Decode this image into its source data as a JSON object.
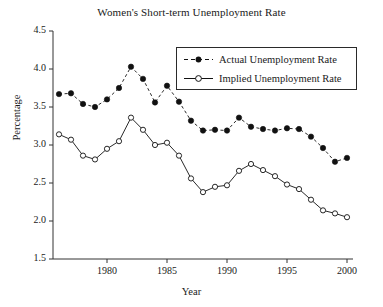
{
  "chart_data": {
    "type": "line",
    "title": "Women's Short-term Unemployment Rate",
    "xlabel": "Year",
    "ylabel": "Percentage",
    "xlim": [
      1975.5,
      2000.5
    ],
    "ylim": [
      1.5,
      4.5
    ],
    "grid": false,
    "legend_position": "upper-right",
    "x_ticks": [
      1980,
      1985,
      1990,
      1995,
      2000
    ],
    "x_tick_labels": [
      "1980",
      "1985",
      "1990",
      "1995",
      "2000"
    ],
    "y_ticks": [
      1.5,
      2.0,
      2.5,
      3.0,
      3.5,
      4.0,
      4.5
    ],
    "y_tick_labels": [
      "1.5",
      "2.0",
      "2.5",
      "3.0",
      "3.5",
      "4.0",
      "4.5"
    ],
    "x": [
      1976,
      1977,
      1978,
      1979,
      1980,
      1981,
      1982,
      1983,
      1984,
      1985,
      1986,
      1987,
      1988,
      1989,
      1990,
      1991,
      1992,
      1993,
      1994,
      1995,
      1996,
      1997,
      1998,
      1999,
      2000
    ],
    "series": [
      {
        "name": "Actual Unemployment Rate",
        "marker": "filled-circle",
        "linestyle": "dashed",
        "color": "#111111",
        "values": [
          3.67,
          3.68,
          3.54,
          3.5,
          3.6,
          3.75,
          4.03,
          3.87,
          3.56,
          3.78,
          3.57,
          3.32,
          3.19,
          3.2,
          3.19,
          3.36,
          3.24,
          3.21,
          3.19,
          3.22,
          3.21,
          3.11,
          2.96,
          2.78,
          2.83
        ]
      },
      {
        "name": "Implied Unemployment Rate",
        "marker": "open-circle",
        "linestyle": "solid",
        "color": "#111111",
        "values": [
          3.14,
          3.07,
          2.86,
          2.81,
          2.95,
          3.05,
          3.36,
          3.2,
          3.0,
          3.03,
          2.86,
          2.56,
          2.38,
          2.45,
          2.47,
          2.66,
          2.75,
          2.67,
          2.59,
          2.48,
          2.42,
          2.28,
          2.14,
          2.1,
          2.05
        ]
      }
    ]
  },
  "legend": {
    "items": [
      {
        "label": "Actual Unemployment Rate"
      },
      {
        "label": "Implied Unemployment Rate"
      }
    ]
  }
}
